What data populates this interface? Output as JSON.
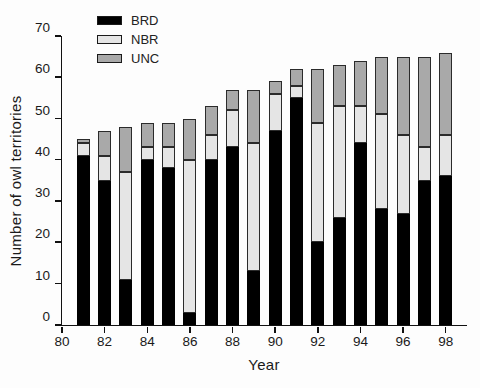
{
  "chart_data": {
    "type": "bar",
    "stacked": true,
    "title": "",
    "xlabel": "Year",
    "ylabel": "Number of owl territories",
    "categories": [
      81,
      82,
      83,
      84,
      85,
      86,
      87,
      88,
      89,
      90,
      91,
      92,
      93,
      94,
      95,
      96,
      97,
      98
    ],
    "series": [
      {
        "name": "BRD",
        "color": "#000000",
        "values": [
          41,
          35,
          11,
          40,
          38,
          3,
          40,
          43,
          13,
          47,
          55,
          20,
          26,
          44,
          28,
          27,
          35,
          36
        ]
      },
      {
        "name": "NBR",
        "color": "#e5e5e5",
        "values": [
          3,
          6,
          26,
          3,
          5,
          37,
          6,
          9,
          31,
          9,
          3,
          29,
          27,
          9,
          23,
          19,
          8,
          10
        ]
      },
      {
        "name": "UNC",
        "color": "#a9a9a9",
        "values": [
          1,
          6,
          11,
          6,
          6,
          10,
          7,
          5,
          13,
          3,
          4,
          13,
          10,
          11,
          14,
          19,
          22,
          20
        ]
      }
    ],
    "totals": [
      45,
      47,
      48,
      49,
      49,
      50,
      53,
      57,
      57,
      59,
      62,
      62,
      63,
      64,
      65,
      65,
      65,
      66
    ],
    "ylim": [
      0,
      70
    ],
    "yticks": [
      0,
      10,
      20,
      30,
      40,
      50,
      60,
      70
    ],
    "xticks": [
      80,
      82,
      84,
      86,
      88,
      90,
      92,
      94,
      96,
      98
    ],
    "x_range": [
      80,
      99
    ],
    "grid": false,
    "legend_position": "top-left-inside",
    "axis_color": "#111111",
    "background_color": "#fdfdfd"
  }
}
